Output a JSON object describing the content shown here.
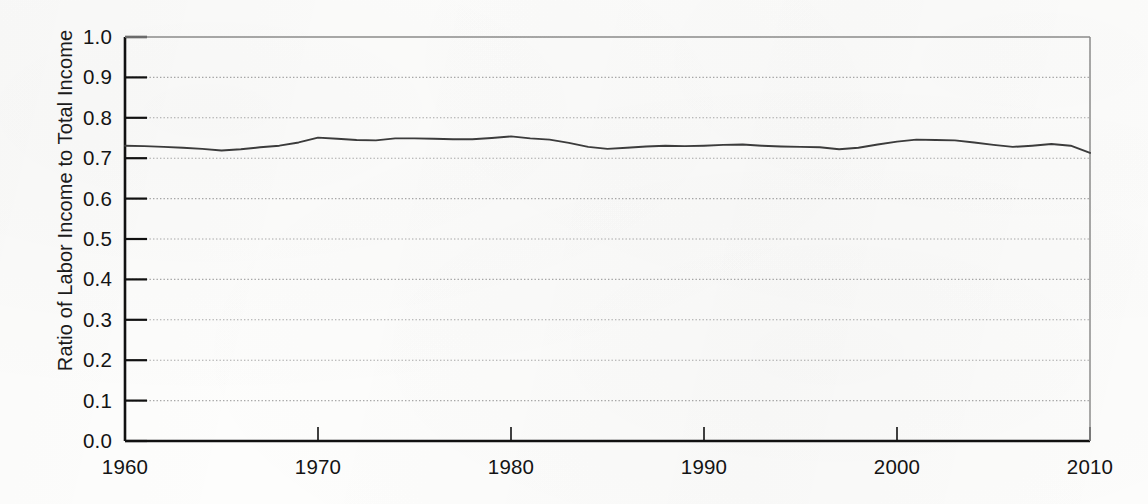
{
  "chart_data": {
    "type": "line",
    "title": "",
    "subtitle": "",
    "xlabel": "",
    "ylabel": "Ratio of Labor Income to Total Income",
    "xlim": [
      1960,
      2010
    ],
    "ylim": [
      0.0,
      1.0
    ],
    "grid": true,
    "grid_style": "dotted-horizontal",
    "legend": "none",
    "x_tick_labels": [
      "1960",
      "1970",
      "1980",
      "1990",
      "2000",
      "2010"
    ],
    "x_ticks": [
      1960,
      1970,
      1980,
      1990,
      2000,
      2010
    ],
    "y_tick_labels": [
      "1.0",
      "0.9",
      "0.8",
      "0.7",
      "0.6",
      "0.5",
      "0.4",
      "0.3",
      "0.2",
      "0.1",
      "0.0"
    ],
    "y_ticks": [
      1.0,
      0.9,
      0.8,
      0.7,
      0.6,
      0.5,
      0.4,
      0.3,
      0.2,
      0.1,
      0.0
    ],
    "line_color": "#3c3c3c",
    "x": [
      1960,
      1961,
      1962,
      1963,
      1964,
      1965,
      1966,
      1967,
      1968,
      1969,
      1970,
      1971,
      1972,
      1973,
      1974,
      1975,
      1976,
      1977,
      1978,
      1979,
      1980,
      1981,
      1982,
      1983,
      1984,
      1985,
      1986,
      1987,
      1988,
      1989,
      1990,
      1991,
      1992,
      1993,
      1994,
      1995,
      1996,
      1997,
      1998,
      1999,
      2000,
      2001,
      2002,
      2003,
      2004,
      2005,
      2006,
      2007,
      2008,
      2009,
      2010
    ],
    "values": [
      0.731,
      0.73,
      0.728,
      0.726,
      0.723,
      0.719,
      0.722,
      0.727,
      0.731,
      0.739,
      0.751,
      0.748,
      0.745,
      0.744,
      0.749,
      0.749,
      0.748,
      0.747,
      0.747,
      0.75,
      0.754,
      0.749,
      0.746,
      0.738,
      0.728,
      0.723,
      0.726,
      0.729,
      0.731,
      0.73,
      0.731,
      0.733,
      0.734,
      0.731,
      0.729,
      0.728,
      0.727,
      0.722,
      0.726,
      0.734,
      0.741,
      0.746,
      0.745,
      0.744,
      0.739,
      0.733,
      0.728,
      0.731,
      0.735,
      0.731,
      0.713
    ],
    "series": [
      {
        "name": "Ratio of Labor Income to Total Income",
        "values": [
          0.731,
          0.73,
          0.728,
          0.726,
          0.723,
          0.719,
          0.722,
          0.727,
          0.731,
          0.739,
          0.751,
          0.748,
          0.745,
          0.744,
          0.749,
          0.749,
          0.748,
          0.747,
          0.747,
          0.75,
          0.754,
          0.749,
          0.746,
          0.738,
          0.728,
          0.723,
          0.726,
          0.729,
          0.731,
          0.73,
          0.731,
          0.733,
          0.734,
          0.731,
          0.729,
          0.728,
          0.727,
          0.722,
          0.726,
          0.734,
          0.741,
          0.746,
          0.745,
          0.744,
          0.739,
          0.733,
          0.728,
          0.731,
          0.735,
          0.731,
          0.713
        ]
      }
    ]
  },
  "axis": {
    "y_title": "Ratio of Labor Income to Total Income"
  },
  "colors": {
    "line": "#3c3c3c",
    "axis": "#111111",
    "grid": "#9a9a9a",
    "background": "#fdfdfc"
  }
}
